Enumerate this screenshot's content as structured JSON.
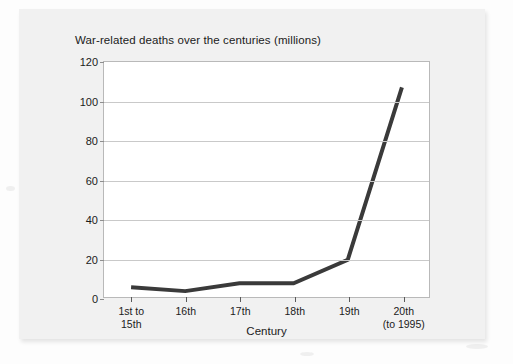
{
  "figure": {
    "title": "War-related deaths over the centuries (millions)"
  },
  "chart_data": {
    "type": "line",
    "title": "War-related deaths over the centuries (millions)",
    "xlabel": "Century",
    "ylabel": "",
    "categories": [
      "1st to\n15th",
      "16th",
      "17th",
      "18th",
      "19th",
      "20th\n(to 1995)"
    ],
    "category_labels": [
      {
        "line1": "1st to",
        "line2": "15th"
      },
      {
        "line1": "16th",
        "line2": ""
      },
      {
        "line1": "17th",
        "line2": ""
      },
      {
        "line1": "18th",
        "line2": ""
      },
      {
        "line1": "19th",
        "line2": ""
      },
      {
        "line1": "20th",
        "line2": "(to 1995)"
      }
    ],
    "values": [
      5,
      3,
      7,
      7,
      19,
      107
    ],
    "ylim": [
      0,
      120
    ],
    "yticks": [
      0,
      20,
      40,
      60,
      80,
      100,
      120
    ],
    "ytick_labels": [
      "0",
      "20",
      "40",
      "60",
      "80",
      "100",
      "120"
    ],
    "grid": true,
    "legend": false,
    "series_color": "#3a3a3a",
    "grid_color": "#c9c9c9",
    "frame_color": "#b9b9b9",
    "line_width": 4
  }
}
